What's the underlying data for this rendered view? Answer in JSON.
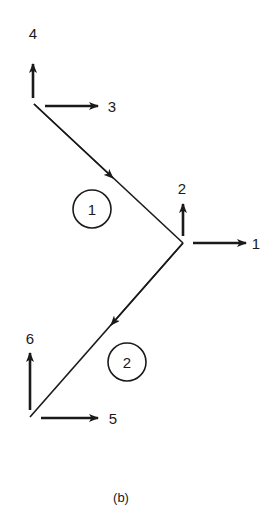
{
  "figure": {
    "caption": "(b)",
    "colors": {
      "stroke": "#1a1a1a",
      "background": "#ffffff"
    },
    "nodes": [
      {
        "id": "top",
        "x": 34,
        "y": 104
      },
      {
        "id": "middle",
        "x": 183,
        "y": 243
      },
      {
        "id": "bottom",
        "x": 30,
        "y": 417
      }
    ],
    "elements": [
      {
        "label": "1",
        "from": "top",
        "to": "middle",
        "direction": "top-to-middle"
      },
      {
        "label": "2",
        "from": "middle",
        "to": "bottom",
        "direction": "middle-to-bottom"
      }
    ],
    "dof_labels": {
      "d1": "1",
      "d2": "2",
      "d3": "3",
      "d4": "4",
      "d5": "5",
      "d6": "6"
    },
    "element_labels": {
      "e1": "1",
      "e2": "2"
    }
  }
}
